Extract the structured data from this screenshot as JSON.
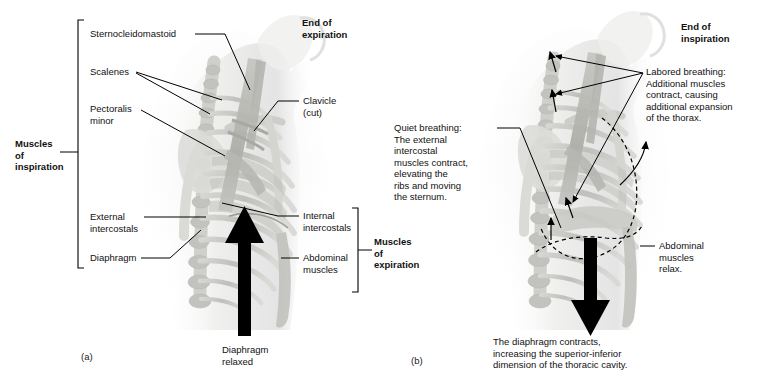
{
  "figure": {
    "panels": [
      {
        "letter": "(a)",
        "heading": "End of\nexpiration",
        "caption": "Diaphragm\nrelaxed",
        "bracket_left_label": "Muscles\nof\ninspiration",
        "bracket_right_label": "Muscles\nof\nexpiration",
        "labels_left": [
          "Sternocleidomastoid",
          "Scalenes",
          "Pectoralis\nminor",
          "External\nintercostals",
          "Diaphragm"
        ],
        "labels_right": [
          "Clavicle\n(cut)",
          "Internal\nintercostals",
          "Abdominal\nmuscles"
        ]
      },
      {
        "letter": "(b)",
        "heading": "End of\ninspiration",
        "caption": "The diaphragm contracts,\nincreasing the superior-inferior\ndimension of the thoracic cavity.",
        "labels": [
          "Labored breathing:\nAdditional muscles\ncontract, causing\nadditional expansion\nof the thorax.",
          "Quiet breathing:\nThe external\nintercostal\nmuscles contract,\nelevating the\nribs and moving\nthe sternum.",
          "Abdominal\nmuscles\nrelax."
        ]
      }
    ],
    "label_strings": {
      "sternocleidomastoid": "Sternocleidomastoid",
      "scalenes": "Scalenes",
      "pectoralis_minor_l1": "Pectoralis",
      "pectoralis_minor_l2": "minor",
      "external_intercostals_l1": "External",
      "external_intercostals_l2": "intercostals",
      "diaphragm": "Diaphragm",
      "clavicle_l1": "Clavicle",
      "clavicle_l2": "(cut)",
      "internal_intercostals_l1": "Internal",
      "internal_intercostals_l2": "intercostals",
      "abdominal_muscles_l1": "Abdominal",
      "abdominal_muscles_l2": "muscles",
      "muscles_of_inspiration_l1": "Muscles",
      "muscles_of_inspiration_l2": "of",
      "muscles_of_inspiration_l3": "inspiration",
      "muscles_of_expiration_l1": "Muscles",
      "muscles_of_expiration_l2": "of",
      "muscles_of_expiration_l3": "expiration",
      "end_of_expiration_l1": "End of",
      "end_of_expiration_l2": "expiration",
      "end_of_inspiration_l1": "End of",
      "end_of_inspiration_l2": "inspiration",
      "diaphragm_relaxed_l1": "Diaphragm",
      "diaphragm_relaxed_l2": "relaxed",
      "labored_l1": "Labored breathing:",
      "labored_l2": "Additional muscles",
      "labored_l3": "contract, causing",
      "labored_l4": "additional expansion",
      "labored_l5": "of the thorax.",
      "quiet_l1": "Quiet breathing:",
      "quiet_l2": "The external",
      "quiet_l3": "intercostal",
      "quiet_l4": "muscles contract,",
      "quiet_l5": "elevating the",
      "quiet_l6": "ribs and moving",
      "quiet_l7": "the sternum.",
      "abd_relax_l1": "Abdominal",
      "abd_relax_l2": "muscles",
      "abd_relax_l3": "relax.",
      "diaphragm_contracts_l1": "The diaphragm contracts,",
      "diaphragm_contracts_l2": "increasing the superior-inferior",
      "diaphragm_contracts_l3": "dimension of the thoracic cavity.",
      "panel_a": "(a)",
      "panel_b": "(b)"
    },
    "colors": {
      "background": "#ffffff",
      "line": "#000000",
      "text": "#111111",
      "bone_light": "#e3e3e1",
      "bone_mid": "#c9c9c6",
      "bone_dark": "#a9a9a5",
      "muscle": "#b9b9b5",
      "arrow": "#000000"
    }
  }
}
